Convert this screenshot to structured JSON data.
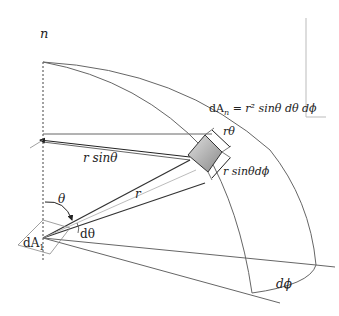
{
  "diagram": {
    "labels": {
      "normal": "n",
      "equation": "dA_n = r² sinθ dθ dϕ",
      "equation_lhs": "dA",
      "equation_sub": "n",
      "equation_rhs": " = r² sinθ dθ dϕ",
      "r_theta": "rθ",
      "r_sin_theta": "r sinθ",
      "r_sin_theta_dphi": "r sinθdϕ",
      "r": "r",
      "theta": "θ",
      "d_theta": "dθ",
      "dA1": "dA",
      "dA1_sub": "1",
      "d_phi": "dϕ"
    },
    "colors": {
      "line": "#555555",
      "patch_fill_light": "#d6d6d6",
      "patch_fill_dark": "#8a8a8a",
      "text": "#222222",
      "axis_dash": "#444444"
    }
  }
}
